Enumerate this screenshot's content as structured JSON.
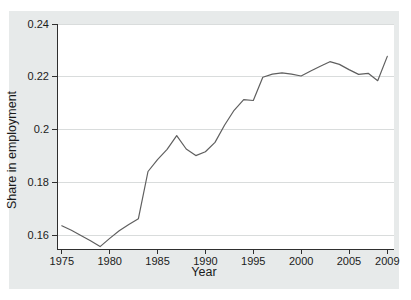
{
  "figure": {
    "page_background": "#ffffff",
    "graph_region_color": "#e7eaea",
    "plot_area_color": "#ffffff",
    "gridline_color": "#d9dcdc",
    "axis_color": "#2f2f2f",
    "text_color": "#1b1b1b",
    "line_color": "#5f5f5f"
  },
  "chart_data": {
    "type": "line",
    "title": "",
    "xlabel": "Year",
    "ylabel": "Share in employment",
    "series_name": "Share in employment",
    "x": [
      1975,
      1976,
      1977,
      1978,
      1979,
      1980,
      1981,
      1982,
      1983,
      1984,
      1985,
      1986,
      1987,
      1988,
      1989,
      1990,
      1991,
      1992,
      1993,
      1994,
      1995,
      1996,
      1997,
      1998,
      1999,
      2000,
      2001,
      2002,
      2003,
      2004,
      2005,
      2006,
      2007,
      2008,
      2009
    ],
    "values": [
      0.1635,
      0.1618,
      0.1598,
      0.1578,
      0.1556,
      0.1587,
      0.1616,
      0.164,
      0.1662,
      0.1841,
      0.1886,
      0.1925,
      0.1977,
      0.1926,
      0.1901,
      0.1916,
      0.1951,
      0.2016,
      0.2073,
      0.2113,
      0.211,
      0.2198,
      0.221,
      0.2215,
      0.221,
      0.2203,
      0.2222,
      0.224,
      0.2257,
      0.2247,
      0.2227,
      0.2209,
      0.2213,
      0.2185,
      0.2277
    ],
    "xlim": [
      1974.5,
      2009.7
    ],
    "ylim": [
      0.1547,
      0.24
    ],
    "x_ticks": {
      "values": [
        1975,
        1980,
        1985,
        1990,
        1995,
        2000,
        2005,
        2009
      ],
      "labels": [
        "1975",
        "1980",
        "1985",
        "1990",
        "1995",
        "2000",
        "2005",
        "2009"
      ]
    },
    "y_ticks": {
      "values": [
        0.16,
        0.18,
        0.2,
        0.22,
        0.24
      ],
      "labels": [
        "0.16",
        "0.18",
        "0.2",
        "0.22",
        "0.24"
      ]
    },
    "grid": true,
    "legend": "none"
  }
}
